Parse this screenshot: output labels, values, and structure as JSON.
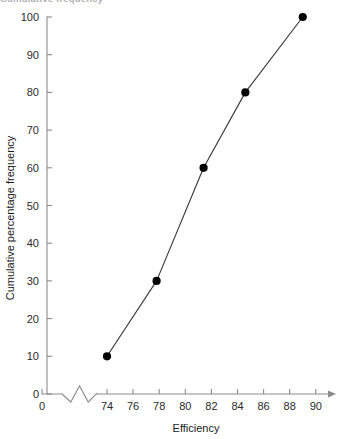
{
  "figure": {
    "cropped_heading": "Cumulative frequency",
    "background_color": "#ffffff",
    "line_color": "#3b3b3f",
    "marker_color": "#000000",
    "axis_color": "#8b8b90"
  },
  "chart_data": {
    "type": "line",
    "title": "",
    "xlabel": "Efficiency",
    "ylabel": "Cumulative percentage frequency",
    "grid": false,
    "legend": false,
    "xlim": [
      73,
      91
    ],
    "ylim": [
      0,
      100
    ],
    "x_axis_break": true,
    "x_origin_label": "0",
    "xticks": [
      74,
      76,
      78,
      80,
      82,
      84,
      86,
      88,
      90
    ],
    "xtick_labels": [
      "74",
      "76",
      "78",
      "80",
      "82",
      "84",
      "86",
      "88",
      "90"
    ],
    "yticks": [
      0,
      10,
      20,
      30,
      40,
      50,
      60,
      70,
      80,
      90,
      100
    ],
    "ytick_labels": [
      "0",
      "10",
      "20",
      "30",
      "40",
      "50",
      "60",
      "70",
      "80",
      "90",
      "100"
    ],
    "series": [
      {
        "name": "Cumulative percentage frequency",
        "marker": "filled-circle",
        "x": [
          74.0,
          77.8,
          81.4,
          84.6,
          89.0
        ],
        "values": [
          10,
          30,
          60,
          80,
          100
        ]
      }
    ]
  }
}
